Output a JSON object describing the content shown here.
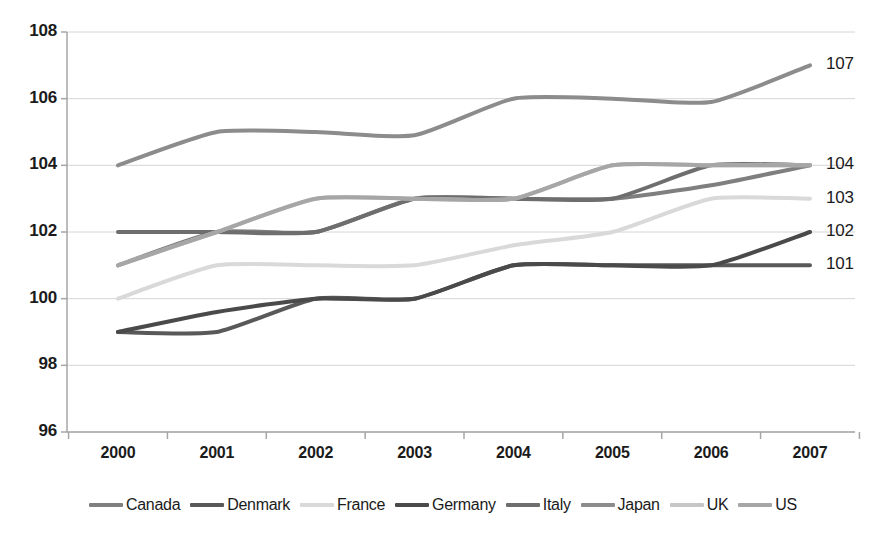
{
  "chart_data": {
    "type": "line",
    "title": "",
    "subtitle": "",
    "xlabel": "",
    "ylabel": "",
    "categories": [
      "2000",
      "2001",
      "2002",
      "2003",
      "2004",
      "2005",
      "2006",
      "2007"
    ],
    "x": [
      2000,
      2001,
      2002,
      2003,
      2004,
      2005,
      2006,
      2007
    ],
    "ylim": [
      96,
      108
    ],
    "yticks": [
      96,
      98,
      100,
      102,
      104,
      106,
      108
    ],
    "ytick_labels": [
      "96",
      "98",
      "100",
      "102",
      "104",
      "106",
      "108"
    ],
    "xtick_labels": [
      "2000",
      "2001",
      "2002",
      "2003",
      "2004",
      "2005",
      "2006",
      "2007"
    ],
    "grid": true,
    "grid_axis": "y",
    "legend_position": "bottom",
    "smoothed": true,
    "end_labels": [
      "107",
      "104",
      "103",
      "102",
      "101"
    ],
    "series": [
      {
        "name": "Canada",
        "color": "#7f7f7f",
        "values": [
          101,
          102,
          102,
          103,
          103,
          103,
          103.4,
          104
        ]
      },
      {
        "name": "Denmark",
        "color": "#595959",
        "values": [
          99,
          99,
          100,
          100,
          101,
          101,
          101,
          101
        ]
      },
      {
        "name": "France",
        "color": "#d9d9d9",
        "values": [
          100,
          101,
          101,
          101,
          101.6,
          102,
          103,
          103
        ]
      },
      {
        "name": "Germany",
        "color": "#4a4a4a",
        "values": [
          99,
          99.6,
          100,
          100,
          101,
          101,
          101,
          102
        ]
      },
      {
        "name": "Italy",
        "color": "#6e6e6e",
        "values": [
          102,
          102,
          102,
          103,
          103,
          103,
          104,
          104
        ]
      },
      {
        "name": "Japan",
        "color": "#8c8c8c",
        "values": [
          104,
          105,
          105,
          104.9,
          106,
          106,
          105.9,
          107
        ]
      },
      {
        "name": "UK",
        "color": "#c6c6c6",
        "values": [
          101,
          102,
          103,
          103,
          103,
          104,
          104,
          104
        ]
      },
      {
        "name": "US",
        "color": "#a6a6a6",
        "values": [
          101,
          102,
          103,
          103,
          103,
          104,
          104,
          104
        ]
      }
    ]
  },
  "axes": {
    "y_values": [
      "108",
      "106",
      "104",
      "102",
      "100",
      "98",
      "96"
    ],
    "x_values": [
      "2000",
      "2001",
      "2002",
      "2003",
      "2004",
      "2005",
      "2006",
      "2007"
    ]
  },
  "labels": {
    "right": [
      "107",
      "104",
      "103",
      "102",
      "101"
    ]
  },
  "legend": {
    "items": [
      {
        "label": "Canada",
        "color": "#7f7f7f"
      },
      {
        "label": "Denmark",
        "color": "#595959"
      },
      {
        "label": "France",
        "color": "#d9d9d9"
      },
      {
        "label": "Germany",
        "color": "#4a4a4a"
      },
      {
        "label": "Italy",
        "color": "#6e6e6e"
      },
      {
        "label": "Japan",
        "color": "#8c8c8c"
      },
      {
        "label": "UK",
        "color": "#c6c6c6"
      },
      {
        "label": "US",
        "color": "#a6a6a6"
      }
    ]
  },
  "colors": {
    "background": "#ffffff",
    "axis": "#a6a6a6",
    "grid": "#d6d6d6",
    "text": "#1b1b1b"
  }
}
